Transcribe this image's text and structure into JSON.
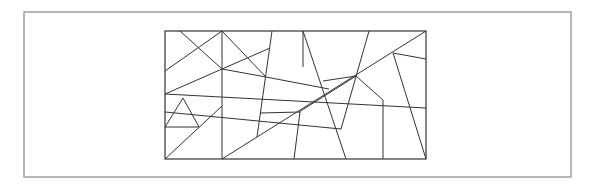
{
  "diagram": {
    "type": "polygon-triangulation",
    "stroke_color": "#333333",
    "frame_color": "#888888",
    "outer_frame": {
      "x": 24,
      "y": 12,
      "width": 547,
      "height": 165
    },
    "inner_rect": {
      "x": 165,
      "y": 31,
      "width": 261,
      "height": 128
    },
    "lines": [
      [
        180,
        31,
        222,
        69
      ],
      [
        165,
        71,
        222,
        31
      ],
      [
        222,
        31,
        222,
        159
      ],
      [
        165,
        94,
        270,
        48
      ],
      [
        222,
        31,
        266,
        77
      ],
      [
        222,
        69,
        266,
        77
      ],
      [
        165,
        94,
        426,
        108
      ],
      [
        183,
        98,
        165,
        127
      ],
      [
        183,
        98,
        199,
        127
      ],
      [
        165,
        127,
        199,
        127
      ],
      [
        165,
        159,
        222,
        106
      ],
      [
        272,
        31,
        257,
        137
      ],
      [
        266,
        77,
        329,
        89
      ],
      [
        303,
        31,
        303,
        67
      ],
      [
        303,
        31,
        346,
        159
      ],
      [
        222,
        159,
        426,
        31
      ],
      [
        369,
        31,
        341,
        129
      ],
      [
        165,
        112,
        341,
        129
      ],
      [
        323,
        81,
        356,
        76
      ],
      [
        299,
        112,
        356,
        76
      ],
      [
        300,
        112,
        294,
        159
      ],
      [
        393,
        53,
        426,
        59
      ],
      [
        393,
        53,
        426,
        159
      ],
      [
        383,
        100,
        383,
        159
      ],
      [
        383,
        100,
        356,
        76
      ],
      [
        260,
        113,
        300,
        112
      ]
    ]
  }
}
